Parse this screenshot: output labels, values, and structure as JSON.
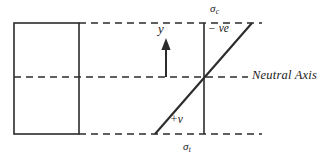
{
  "diagram": {
    "colors": {
      "stroke": "#2b2b2b",
      "dashed_stroke": "#2b2b2b",
      "text": "#1a1a1a",
      "background": "#ffffff"
    },
    "labels": {
      "neutral_axis": "Neutral Axis",
      "y_axis": "y",
      "negative_ve": "− ve",
      "positive_v": "+v",
      "sigma_compression_symbol": "σ",
      "sigma_compression_subscript": "c",
      "sigma_tension_symbol": "σ",
      "sigma_tension_subscript": "t"
    },
    "geometry": {
      "section_rect": {
        "x": 14,
        "y": 23,
        "width": 65,
        "height": 111
      },
      "top_fibre_line": {
        "x1": 79,
        "y1": 23,
        "x2": 262,
        "y2": 23
      },
      "neutral_axis_line": {
        "x1": 14,
        "y1": 77,
        "x2": 248,
        "y2": 77
      },
      "bottom_fibre_line": {
        "x1": 79,
        "y1": 134,
        "x2": 262,
        "y2": 134
      },
      "stress_reference_line": {
        "x1": 204,
        "y1": 23,
        "x2": 204,
        "y2": 134
      },
      "stress_profile_line": {
        "x1": 155,
        "y1": 134,
        "x2": 252,
        "y2": 23
      },
      "y_arrow": {
        "x": 166,
        "y_tail": 77,
        "y_head": 41
      }
    }
  }
}
